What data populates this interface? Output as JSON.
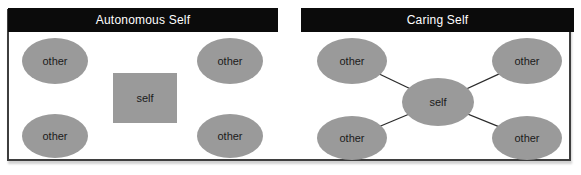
{
  "diagram": {
    "panels": [
      {
        "title": "Autonomous Self",
        "self": {
          "label": "self",
          "shape": "rectangle"
        },
        "others": [
          {
            "label": "other",
            "position": "top-left"
          },
          {
            "label": "other",
            "position": "top-right"
          },
          {
            "label": "other",
            "position": "bottom-left"
          },
          {
            "label": "other",
            "position": "bottom-right"
          }
        ],
        "connections": "none"
      },
      {
        "title": "Caring Self",
        "self": {
          "label": "self",
          "shape": "ellipse"
        },
        "others": [
          {
            "label": "other",
            "position": "top-left"
          },
          {
            "label": "other",
            "position": "top-right"
          },
          {
            "label": "other",
            "position": "bottom-left"
          },
          {
            "label": "other",
            "position": "bottom-right"
          }
        ],
        "connections": "self-to-each-other"
      }
    ],
    "colors": {
      "node_fill": "#9a9a9a",
      "header_background": "#0b0b0b",
      "header_text": "#ffffff",
      "frame_border": "#3e3e3e",
      "node_text": "#1a1a1a",
      "connection_line": "#2b2b2b",
      "background": "#ffffff"
    }
  }
}
